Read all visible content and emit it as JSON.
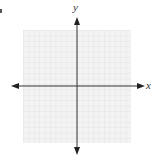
{
  "diagram": {
    "type": "coordinate-grid",
    "axes": {
      "x_label": "x",
      "y_label": "y",
      "x_arrows": "both",
      "y_arrows": "both"
    },
    "grid": {
      "color": "#e4e4e4",
      "background": "#f2f2f2",
      "axis_color": "#333333"
    }
  }
}
